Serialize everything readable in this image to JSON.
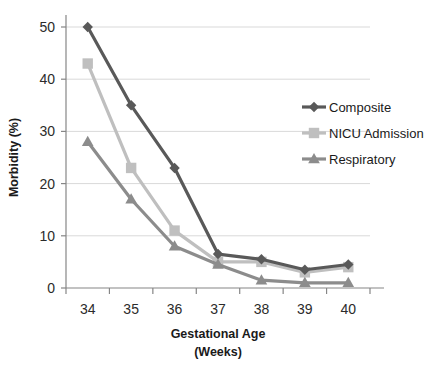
{
  "chart_data": {
    "type": "line",
    "title": "",
    "xlabel": "Gestational Age (Weeks)",
    "xlabel_line1": "Gestational Age",
    "xlabel_line2": "(Weeks)",
    "ylabel": "Morbidity (%)",
    "categories": [
      "34",
      "35",
      "36",
      "37",
      "38",
      "39",
      "40"
    ],
    "x": [
      34,
      35,
      36,
      37,
      38,
      39,
      40
    ],
    "ylim": [
      0,
      50
    ],
    "yticks": [
      0,
      10,
      20,
      30,
      40,
      50
    ],
    "ytick_labels": [
      "0",
      "10",
      "20",
      "30",
      "40",
      "50"
    ],
    "grid": "horizontal",
    "legend_position": "right-top",
    "series": [
      {
        "name": "Composite",
        "marker": "diamond",
        "color": "#595959",
        "values": [
          50,
          35,
          23,
          6.5,
          5.5,
          3.5,
          4.5
        ]
      },
      {
        "name": "NICU Admission",
        "marker": "square",
        "color": "#bfbfbf",
        "values": [
          43,
          23,
          11,
          5,
          5,
          3,
          4
        ]
      },
      {
        "name": "Respiratory",
        "marker": "triangle",
        "color": "#8c8c8c",
        "values": [
          28,
          17,
          8,
          4.5,
          1.5,
          1,
          1
        ]
      }
    ]
  },
  "colors": {
    "composite": "#595959",
    "nicu": "#bfbfbf",
    "respiratory": "#8c8c8c",
    "axis": "#868686",
    "gridline": "#d9d9d9",
    "background": "#ffffff"
  }
}
